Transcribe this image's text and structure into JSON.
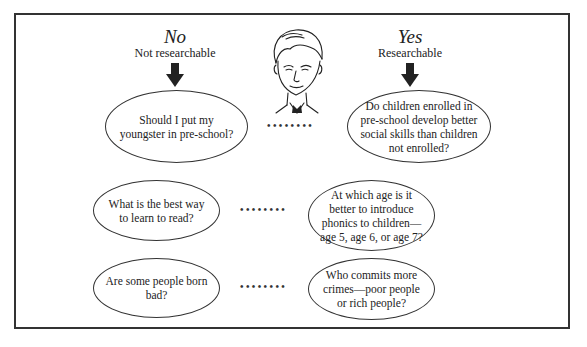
{
  "columns": {
    "no": {
      "title": "No",
      "subtitle": "Not researchable"
    },
    "yes": {
      "title": "Yes",
      "subtitle": "Researchable"
    }
  },
  "rows": [
    {
      "not_researchable": "Should I put my youngster in pre-school?",
      "researchable": "Do children enrolled in pre-school develop better social skills than children not enrolled?"
    },
    {
      "not_researchable": "What is the best way to learn to read?",
      "researchable": "At which age is it better to introduce phonics to children—age 5, age 6, or age 7?"
    },
    {
      "not_researchable": "Are some people born bad?",
      "researchable": "Who commits more crimes—poor people or rich people?"
    }
  ],
  "connector": "••••••••",
  "icons": {
    "figure": "man-face-illustration",
    "arrow": "arrow-down"
  },
  "colors": {
    "stroke": "#333333",
    "background": "#ffffff"
  }
}
